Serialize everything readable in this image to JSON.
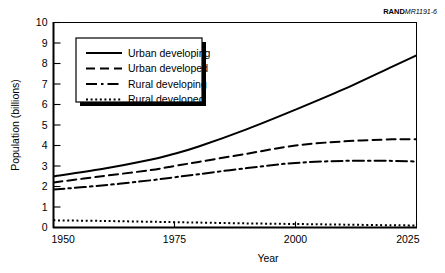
{
  "figure": {
    "corner_id_bold": "RAND",
    "corner_id_italic": "MR1191-6",
    "background_color": "#ffffff",
    "ink_color": "#000000"
  },
  "chart_data": {
    "type": "line",
    "title": "",
    "xlabel": "Year",
    "ylabel": "Population (billions)",
    "xlim": [
      1950,
      2025
    ],
    "ylim": [
      0,
      10
    ],
    "xticks": [
      1950,
      1975,
      2000,
      2025
    ],
    "yticks": [
      0,
      1,
      2,
      3,
      4,
      5,
      6,
      7,
      8,
      9,
      10
    ],
    "grid": false,
    "legend_position": "upper-left-inside",
    "x": [
      1950,
      1960,
      1970,
      1975,
      1980,
      1990,
      2000,
      2010,
      2020,
      2025
    ],
    "series": [
      {
        "name": "Urban developing",
        "style": "solid",
        "values": [
          2.5,
          2.85,
          3.3,
          3.6,
          3.95,
          4.8,
          5.75,
          6.75,
          7.85,
          8.4
        ]
      },
      {
        "name": "Urban developed",
        "style": "dashed",
        "values": [
          2.2,
          2.5,
          2.8,
          3.0,
          3.2,
          3.6,
          4.0,
          4.2,
          4.3,
          4.3
        ]
      },
      {
        "name": "Rural developing",
        "style": "dash-dot",
        "values": [
          1.85,
          2.05,
          2.3,
          2.45,
          2.6,
          2.9,
          3.15,
          3.25,
          3.25,
          3.22
        ]
      },
      {
        "name": "Rural developed",
        "style": "dotted",
        "values": [
          0.35,
          0.32,
          0.28,
          0.26,
          0.24,
          0.2,
          0.17,
          0.14,
          0.11,
          0.1
        ]
      }
    ]
  },
  "legend": {
    "items": [
      {
        "label": "Urban developing",
        "style": "solid"
      },
      {
        "label": "Urban developed",
        "style": "dashed"
      },
      {
        "label": "Rural developing",
        "style": "dash-dot"
      },
      {
        "label": "Rural developed",
        "style": "dotted"
      }
    ]
  }
}
